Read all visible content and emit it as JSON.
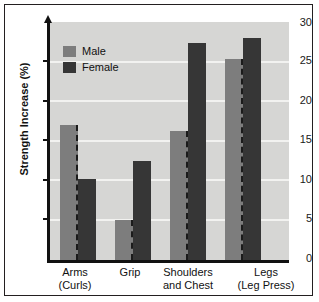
{
  "chart_data": {
    "type": "bar",
    "title": "",
    "xlabel": "",
    "ylabel": "Strength Increase (%)",
    "ylim": [
      0,
      30
    ],
    "yticks": [
      0,
      5,
      10,
      15,
      20,
      25,
      30
    ],
    "grid": true,
    "legend_position": "top-left",
    "categories": [
      "Arms\n(Curls)",
      "Grip",
      "Shoulders\nand Chest",
      "Legs\n(Leg Press)"
    ],
    "category_lines": [
      [
        "Arms",
        "(Curls)"
      ],
      [
        "Grip",
        ""
      ],
      [
        "Shoulders",
        "and Chest"
      ],
      [
        "Legs",
        "(Leg Press)"
      ]
    ],
    "series": [
      {
        "name": "Male",
        "color": "#7d7d7d",
        "values": [
          17.0,
          5.0,
          16.3,
          25.3
        ]
      },
      {
        "name": "Female",
        "color": "#363636",
        "values": [
          10.2,
          12.5,
          27.3,
          28.0
        ]
      }
    ]
  },
  "axis": {
    "tick_0": "0",
    "tick_5": "5",
    "tick_10": "10",
    "tick_15": "15",
    "tick_20": "20",
    "tick_25": "25",
    "tick_30": "30"
  },
  "legend": {
    "male_label": "Male",
    "female_label": "Female"
  },
  "labels": {
    "cat0_line0": "Arms",
    "cat0_line1": "(Curls)",
    "cat1_line0": "Grip",
    "cat1_line1": "",
    "cat2_line0": "Shoulders",
    "cat2_line1": "and Chest",
    "cat3_line0": "Legs",
    "cat3_line1": "(Leg Press)"
  },
  "colors": {
    "male": "#7d7d7d",
    "female": "#363636",
    "plot_background": "#d6d6d4",
    "gridline": "#f2f2f0",
    "axis": "#111111",
    "frame": "#231f20"
  }
}
